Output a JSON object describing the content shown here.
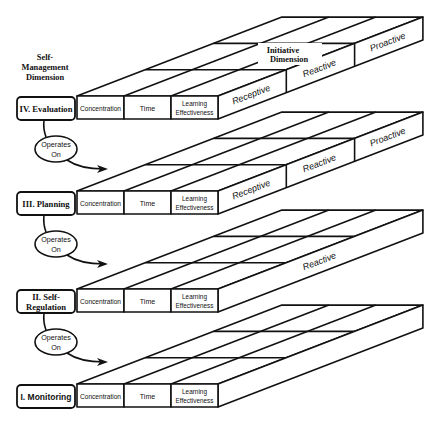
{
  "diagram": {
    "self_management_title": [
      "Self-",
      "Management",
      "Dimension"
    ],
    "initiative_title": [
      "Initiative",
      "Dimension"
    ],
    "operates_on": [
      "Operates",
      "On"
    ],
    "columns": [
      "Concentration",
      "Time",
      "Learning|Effectiveness"
    ],
    "levels": [
      {
        "label": [
          "IV. Evaluation"
        ],
        "side_labels": [
          "Receptive",
          "Reactive",
          "Proactive"
        ],
        "side_dividers": true
      },
      {
        "label": [
          "III. Planning"
        ],
        "side_labels": [
          "Receptive",
          "Reactive",
          "Proactive"
        ],
        "side_dividers": true
      },
      {
        "label": [
          "II. Self-",
          "Regulation"
        ],
        "side_labels": [
          "",
          "Reactive",
          ""
        ],
        "side_dividers": false
      },
      {
        "label": [
          "I. Monitoring"
        ],
        "side_labels": [
          "",
          "",
          ""
        ],
        "side_dividers": false
      }
    ],
    "colors": {
      "line": "#111111",
      "background": "#ffffff"
    }
  }
}
